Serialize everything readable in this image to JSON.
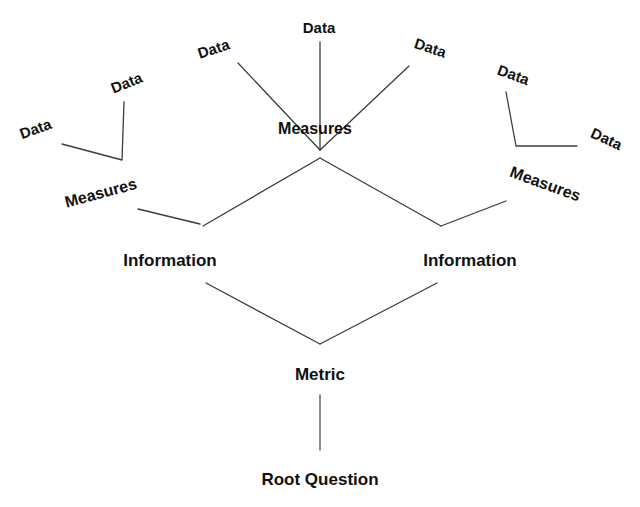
{
  "diagram": {
    "type": "tree",
    "background_color": "#ffffff",
    "line_color": "#3c3c3c",
    "text_color": "#111111",
    "levels": [
      "Data",
      "Measures",
      "Information",
      "Metric",
      "Root Question"
    ],
    "nodes": [
      {
        "id": "data-1",
        "label": "Data",
        "level": "Data",
        "x": 36,
        "y": 130,
        "rotation": -20
      },
      {
        "id": "data-2",
        "label": "Data",
        "level": "Data",
        "x": 127,
        "y": 84,
        "rotation": -22
      },
      {
        "id": "data-3",
        "label": "Data",
        "level": "Data",
        "x": 214,
        "y": 50,
        "rotation": -18
      },
      {
        "id": "data-4",
        "label": "Data",
        "level": "Data",
        "x": 319,
        "y": 29,
        "rotation": 0
      },
      {
        "id": "data-5",
        "label": "Data",
        "level": "Data",
        "x": 430,
        "y": 49,
        "rotation": 18
      },
      {
        "id": "data-6",
        "label": "Data",
        "level": "Data",
        "x": 513,
        "y": 76,
        "rotation": 20
      },
      {
        "id": "data-7",
        "label": "Data",
        "level": "Data",
        "x": 606,
        "y": 140,
        "rotation": 25
      },
      {
        "id": "meas-left",
        "label": "Measures",
        "level": "Measures",
        "x": 101,
        "y": 194,
        "rotation": -15
      },
      {
        "id": "meas-center",
        "label": "Measures",
        "level": "Measures",
        "x": 315,
        "y": 130,
        "rotation": 0
      },
      {
        "id": "meas-right",
        "label": "Measures",
        "level": "Measures",
        "x": 545,
        "y": 185,
        "rotation": 20
      },
      {
        "id": "info-left",
        "label": "Information",
        "level": "Information",
        "x": 170,
        "y": 262,
        "rotation": 0
      },
      {
        "id": "info-right",
        "label": "Information",
        "level": "Information",
        "x": 470,
        "y": 262,
        "rotation": 0
      },
      {
        "id": "metric",
        "label": "Metric",
        "level": "Metric",
        "x": 320,
        "y": 376,
        "rotation": 0
      },
      {
        "id": "root",
        "label": "Root Question",
        "level": "Root Question",
        "x": 320,
        "y": 481,
        "rotation": 0
      }
    ],
    "edges": [
      {
        "from": "data-1",
        "to": "data-2-elbow",
        "points": "62,144 122,160 124,102"
      },
      {
        "from": "data-3",
        "to": "meas-center",
        "points": "238,63 320,150"
      },
      {
        "from": "data-4",
        "to": "meas-center",
        "points": "320,42 320,150"
      },
      {
        "from": "data-5",
        "to": "meas-center",
        "points": "409,66 320,150"
      },
      {
        "from": "data-6",
        "to": "data-7-elbow",
        "points": "506,92 516,146 577,146"
      },
      {
        "from": "meas-left",
        "to": "info-left",
        "points": "138,209 200,224"
      },
      {
        "from": "meas-center",
        "to": "info-left",
        "points": "320,158 203,226"
      },
      {
        "from": "meas-center",
        "to": "info-right",
        "points": "320,158 441,226"
      },
      {
        "from": "meas-right",
        "to": "info-right",
        "points": "506,201 441,226"
      },
      {
        "from": "info-left",
        "to": "metric",
        "points": "206,283 320,344"
      },
      {
        "from": "info-right",
        "to": "metric",
        "points": "437,283 320,344"
      },
      {
        "from": "metric",
        "to": "root",
        "points": "320,395 320,450"
      }
    ]
  }
}
